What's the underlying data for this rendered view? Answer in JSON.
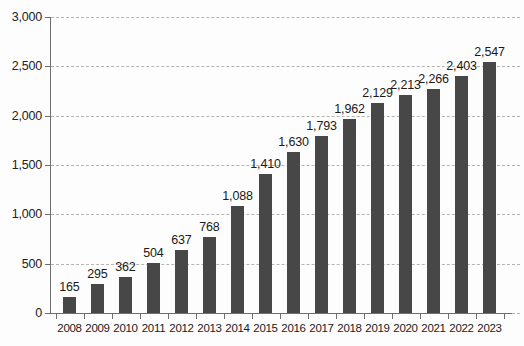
{
  "chart_data": {
    "type": "bar",
    "title": "",
    "subtitle": "",
    "xlabel": "",
    "ylabel": "",
    "categories": [
      "2008",
      "2009",
      "2010",
      "2011",
      "2012",
      "2013",
      "2014",
      "2015",
      "2016",
      "2017",
      "2018",
      "2019",
      "2020",
      "2021",
      "2022",
      "2023"
    ],
    "values": [
      165,
      295,
      362,
      504,
      637,
      768,
      1088,
      1410,
      1630,
      1793,
      1962,
      2129,
      2213,
      2266,
      2403,
      2547
    ],
    "data_labels": [
      "165",
      "295",
      "362",
      "504",
      "637",
      "768",
      "1,088",
      "1,410",
      "1,630",
      "1,793",
      "1,962",
      "2,129",
      "2,213",
      "2,266",
      "2,403",
      "2,547"
    ],
    "ylim": [
      0,
      3000
    ],
    "ytick_values": [
      0,
      500,
      1000,
      1500,
      2000,
      2500,
      3000
    ],
    "ytick_labels": [
      "0",
      "500",
      "1,000",
      "1,500",
      "2,000",
      "2,500",
      "3,000"
    ],
    "grid": true,
    "grid_style": "dashed-horizontal",
    "legend": "none",
    "bar_color": "#474747",
    "grid_color": "#b4b4b4",
    "axis_color": "#6e6e6e",
    "background_color": "#fdfdfd",
    "text_color": "#1a1a1a"
  }
}
